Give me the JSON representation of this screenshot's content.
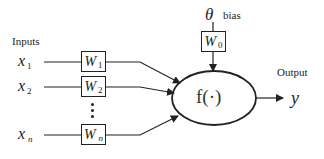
{
  "diagram": {
    "inputs_label": "Inputs",
    "output_label": "Output",
    "bias_label": "bias",
    "bias_symbol": "θ",
    "activation": "f(·)",
    "output_symbol": "y",
    "inputs": [
      {
        "var": "x",
        "sub": "1",
        "weight": "W",
        "weight_sub": "1"
      },
      {
        "var": "x",
        "sub": "2",
        "weight": "W",
        "weight_sub": "2"
      },
      {
        "var": "x",
        "sub": "n",
        "weight": "W",
        "weight_sub": "n"
      }
    ],
    "bias_weight": {
      "weight": "W",
      "weight_sub": "0"
    },
    "ellipsis": "⋮",
    "colors": {
      "line": "#222222",
      "background": "#ffffff"
    }
  }
}
